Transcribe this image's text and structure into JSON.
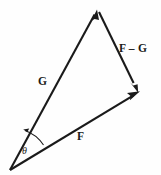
{
  "figure": {
    "kind": "vector-triangle-diagram",
    "width": 161,
    "height": 175,
    "background_color": "#fefefe",
    "stroke_color": "#1a1a1a",
    "labels": {
      "g": "G",
      "f": "F",
      "f_minus_g": "F – G",
      "theta": "θ"
    },
    "vectors": [
      {
        "name": "G",
        "label": "G",
        "from": [
          10,
          170
        ],
        "to": [
          97,
          10
        ],
        "arrow_at": "to"
      },
      {
        "name": "F",
        "label": "F",
        "from": [
          10,
          170
        ],
        "to": [
          139,
          92
        ],
        "arrow_at": "to"
      },
      {
        "name": "F-G",
        "label": "F – G",
        "from": [
          99,
          12
        ],
        "to": [
          138,
          92
        ],
        "arrow_at": "to"
      }
    ],
    "angle_arc": {
      "label": "θ",
      "vertex": [
        10,
        170
      ],
      "between": [
        "F",
        "G"
      ],
      "arrow_at": "G"
    }
  }
}
